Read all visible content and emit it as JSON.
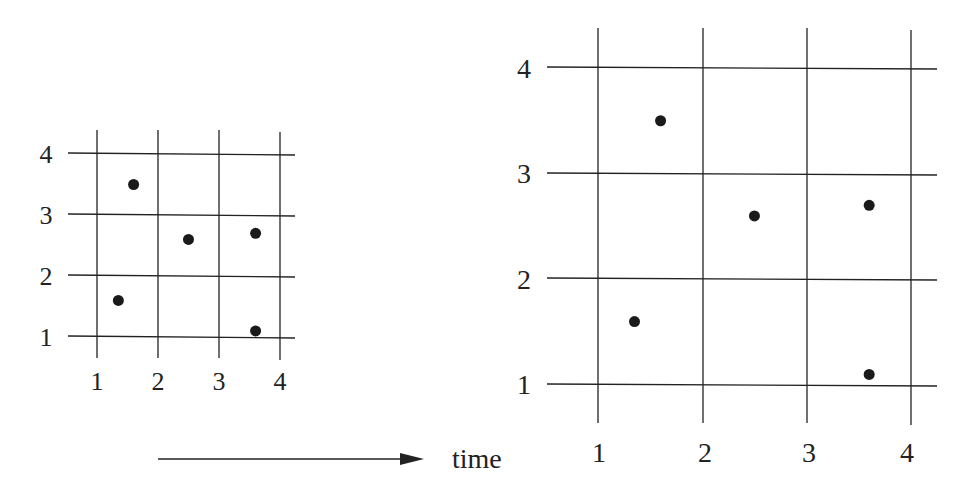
{
  "figure": {
    "arrow_label": "time",
    "ink_color": "#222222",
    "point_color": "#1a1a1a"
  },
  "panels": [
    {
      "name": "small-grid",
      "x_ticks": [
        "1",
        "2",
        "3",
        "4"
      ],
      "y_ticks": [
        "1",
        "2",
        "3",
        "4"
      ],
      "points": [
        {
          "x": 1.6,
          "y": 3.5
        },
        {
          "x": 2.5,
          "y": 2.6
        },
        {
          "x": 3.6,
          "y": 2.7
        },
        {
          "x": 1.35,
          "y": 1.6
        },
        {
          "x": 3.6,
          "y": 1.1
        }
      ]
    },
    {
      "name": "large-grid",
      "x_ticks": [
        "1",
        "2",
        "3",
        "4"
      ],
      "y_ticks": [
        "1",
        "2",
        "3",
        "4"
      ],
      "points": [
        {
          "x": 1.6,
          "y": 3.5
        },
        {
          "x": 2.5,
          "y": 2.6
        },
        {
          "x": 3.6,
          "y": 2.7
        },
        {
          "x": 1.35,
          "y": 1.6
        },
        {
          "x": 3.6,
          "y": 1.1
        }
      ]
    }
  ]
}
